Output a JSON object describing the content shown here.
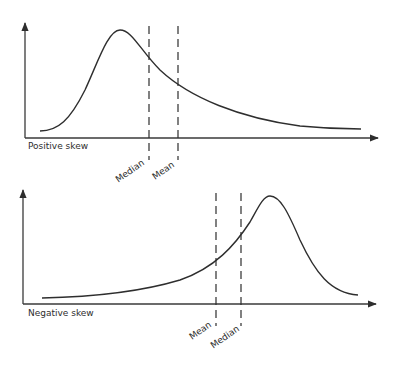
{
  "diagrams": [
    {
      "id": "positive",
      "caption": "Positive skew",
      "markers": [
        {
          "label": "Median",
          "x": 149
        },
        {
          "label": "Mean",
          "x": 178
        }
      ]
    },
    {
      "id": "negative",
      "caption": "Negative skew",
      "markers": [
        {
          "label": "Mean",
          "x": 216
        },
        {
          "label": "Median",
          "x": 241
        }
      ]
    }
  ],
  "colors": {
    "line": "#2e2e2e",
    "background": "#ffffff"
  }
}
